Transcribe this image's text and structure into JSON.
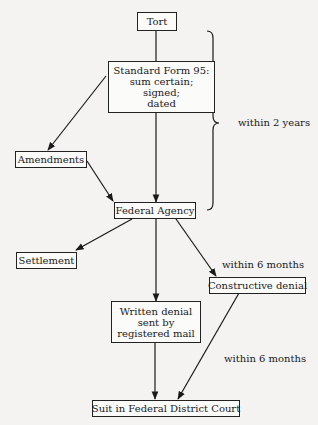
{
  "header_fragment": "",
  "nodes": {
    "tort": {
      "lines": [
        "Tort"
      ]
    },
    "sf95": {
      "lines": [
        "Standard Form 95:",
        "sum certain;",
        "signed;",
        "dated"
      ]
    },
    "amendments": {
      "lines": [
        "Amendments"
      ]
    },
    "agency": {
      "lines": [
        "Federal Agency"
      ]
    },
    "settlement": {
      "lines": [
        "Settlement"
      ]
    },
    "constructive": {
      "lines": [
        "Constructive denial"
      ]
    },
    "written": {
      "lines": [
        "Written denial",
        "sent by",
        "registered mail"
      ]
    },
    "suit": {
      "lines": [
        "Suit in Federal District Court"
      ]
    }
  },
  "labels": {
    "within_2_years": "within 2 years",
    "within_6_months_a": "within 6 months",
    "within_6_months_b": "within 6 months"
  },
  "edges": [
    {
      "from": "tort",
      "to": "sf95",
      "arrow": false
    },
    {
      "from": "sf95",
      "to": "agency",
      "arrow": true
    },
    {
      "from": "sf95",
      "to": "amendments",
      "arrow": true
    },
    {
      "from": "amendments",
      "to": "agency",
      "arrow": true
    },
    {
      "from": "agency",
      "to": "settlement",
      "arrow": true
    },
    {
      "from": "agency",
      "to": "constructive",
      "arrow": true,
      "label": "within 6 months"
    },
    {
      "from": "agency",
      "to": "written",
      "arrow": true
    },
    {
      "from": "written",
      "to": "suit",
      "arrow": true
    },
    {
      "from": "constructive",
      "to": "suit",
      "arrow": true,
      "label": "within 6 months"
    }
  ],
  "brace": {
    "span": [
      "tort",
      "agency"
    ],
    "label": "within 2 years"
  },
  "colors": {
    "line": "#1a1a1a",
    "background": "#f4f3f1"
  }
}
